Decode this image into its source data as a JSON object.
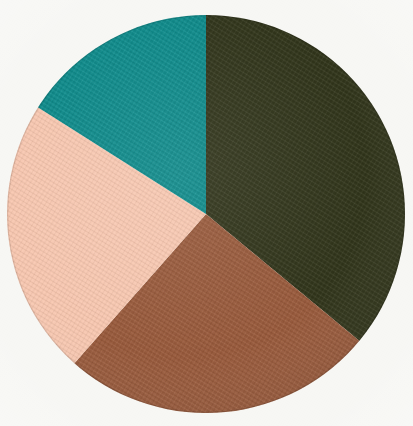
{
  "figure": {
    "background_color": "#f7f7f4",
    "type": "pie-chart-plate"
  },
  "chart_data": {
    "type": "pie",
    "title": "",
    "subtitle": "",
    "xlabel": "",
    "ylabel": "",
    "legend": "none",
    "grid": false,
    "labels_shown": false,
    "start_angle_deg": 0,
    "direction": "clockwise",
    "center_px": [
      206,
      214
    ],
    "radius_px": 199,
    "categories": [
      "Dark olive green",
      "Brown",
      "Pink",
      "Teal"
    ],
    "values": [
      36.0,
      25.5,
      22.5,
      16.0
    ],
    "unit": "percent",
    "colors": [
      "#31351b",
      "#985a3c",
      "#f7c7b0",
      "#0e8a8a"
    ],
    "slices": [
      {
        "name": "Dark olive green",
        "color": "#31351b",
        "value": 36.0,
        "start_angle_deg": 0,
        "end_angle_deg": 129.6,
        "sweep_deg": 129.6
      },
      {
        "name": "Brown",
        "color": "#985a3c",
        "value": 25.5,
        "start_angle_deg": 129.6,
        "end_angle_deg": 221.4,
        "sweep_deg": 91.8
      },
      {
        "name": "Pink",
        "color": "#f7c7b0",
        "value": 22.5,
        "start_angle_deg": 221.4,
        "end_angle_deg": 302.4,
        "sweep_deg": 81.0
      },
      {
        "name": "Teal",
        "color": "#0e8a8a",
        "value": 16.0,
        "start_angle_deg": 302.4,
        "end_angle_deg": 360.0,
        "sweep_deg": 57.6
      }
    ]
  }
}
